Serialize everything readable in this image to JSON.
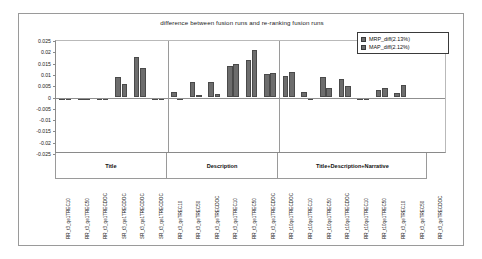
{
  "chart_data": {
    "type": "bar",
    "title": "difference between fusion runs and re-ranking fusion runs",
    "xlabel": "",
    "ylabel": "",
    "ylim": [
      -0.025,
      0.025
    ],
    "ytick_labels": [
      "0.025",
      "0.02",
      "0.015",
      "0.01",
      "0.005",
      "0",
      "-0.005",
      "-0.01",
      "-0.015",
      "-0.02",
      "-0.025"
    ],
    "ytick_values": [
      0.025,
      0.02,
      0.015,
      0.01,
      0.005,
      0,
      -0.005,
      -0.01,
      -0.015,
      -0.02,
      -0.025
    ],
    "grid": false,
    "legend_position": "top-right",
    "legend": [
      "MRP_diff(2.13%)",
      "MAP_diff(2.12%)"
    ],
    "group_labels": [
      "Title",
      "Description",
      "Title+Description+Narrative"
    ],
    "group_sizes": [
      6,
      6,
      8
    ],
    "categories": [
      "RR_t3_qe1TREC10",
      "RR_t3_qe1TREC50",
      "RR_t3_qe1TRECDOC",
      "SR_t3_qe1TRECDOC",
      "SR_t3_qe1TRECDOC",
      "SR_t3_qe1TRECDOC",
      "RR_t3_qeTREC10",
      "RR_t3_qeTREC50",
      "RR_t3_qeTRECDOC",
      "RR_t3_qe1TREC10",
      "RR_t3_qe1TREC50",
      "RR_t3_qe1TRECDOC",
      "RR_t10qe1TRECDOC",
      "RR_t10qe1TREC10",
      "RR_t10qe1TREC50",
      "RR_t10qe1TRECDOC",
      "RR_t10qe1TREC10",
      "RR_t10qe1TREC50",
      "RR_t3_qeTREC10",
      "RR_t3_qeTREC50",
      "RR_t3_qeTRECDOC"
    ],
    "series": [
      {
        "name": "MRP_diff(2.13%)",
        "values": [
          -0.0008,
          -0.0009,
          -0.0004,
          0.0089,
          0.0178,
          -0.0005,
          0.0024,
          0.0068,
          0.0068,
          0.014,
          0.0167,
          0.0105,
          0.0097,
          0.0023,
          0.0092,
          0.0082,
          -0.0006,
          0.0035,
          0.0021,
          0.0,
          0.0
        ]
      },
      {
        "name": "MAP_diff(2.12%)",
        "values": [
          -0.0008,
          -0.0009,
          -0.0005,
          0.0061,
          0.0132,
          -0.0006,
          -0.0011,
          0.001,
          0.0014,
          0.015,
          0.0211,
          0.0107,
          0.0111,
          -0.0009,
          0.0042,
          0.0052,
          -0.0005,
          0.0041,
          0.0054,
          0.0,
          0.0
        ]
      }
    ]
  }
}
